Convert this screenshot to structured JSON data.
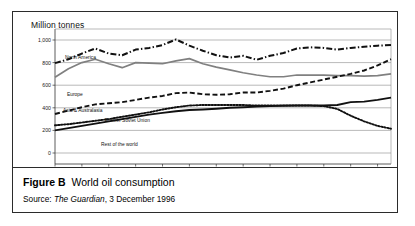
{
  "figure": {
    "label": "Figure B",
    "title": "World oil consumption",
    "source_prefix": "Source:",
    "source_publication": "The Guardian",
    "source_date": ", 3 December 1996"
  },
  "chart_data": {
    "type": "line",
    "title": "World oil consumption",
    "axis_unit_label": "Million tonnes",
    "xlabel": "",
    "ylabel": "Million tonnes",
    "ylim": [
      0,
      1000
    ],
    "yticks": [
      0,
      200,
      400,
      600,
      800,
      1000
    ],
    "ytick_labels": [
      "0",
      "200",
      "400",
      "600",
      "800",
      "1,000"
    ],
    "grid": "horizontal",
    "legend_position": "inline-labels",
    "x": [
      1970,
      1971,
      1972,
      1973,
      1974,
      1975,
      1976,
      1977,
      1978,
      1979,
      1980,
      1981,
      1982,
      1983,
      1984,
      1985,
      1986,
      1987,
      1988,
      1989,
      1990,
      1991,
      1992,
      1993,
      1994,
      1995
    ],
    "xtick_labels": [
      "1970",
      "1972",
      "1974",
      "1976",
      "1978",
      "1980",
      "1982",
      "1984",
      "1986",
      "1988",
      "1990",
      "1992",
      "1994"
    ],
    "series": [
      {
        "name": "North America",
        "style": "dash-dot",
        "color": "#111111",
        "values": [
          795,
          830,
          880,
          925,
          880,
          865,
          915,
          930,
          955,
          1005,
          950,
          905,
          865,
          845,
          860,
          825,
          860,
          885,
          925,
          935,
          930,
          915,
          930,
          940,
          950,
          955
        ]
      },
      {
        "name": "Europe",
        "style": "solid-gray",
        "color": "#808080",
        "values": [
          670,
          745,
          800,
          830,
          790,
          755,
          800,
          795,
          790,
          815,
          835,
          790,
          760,
          735,
          710,
          690,
          675,
          675,
          690,
          690,
          690,
          685,
          685,
          680,
          685,
          700
        ]
      },
      {
        "name": "Asia & Australasia",
        "style": "dashed",
        "color": "#111111",
        "values": [
          345,
          375,
          405,
          430,
          440,
          450,
          470,
          490,
          505,
          530,
          535,
          520,
          515,
          520,
          535,
          535,
          550,
          570,
          600,
          625,
          650,
          675,
          700,
          730,
          775,
          830
        ]
      },
      {
        "name": "Former Soviet Union",
        "style": "dotted",
        "color": "#111111",
        "values": [
          245,
          255,
          270,
          285,
          300,
          320,
          340,
          360,
          385,
          405,
          420,
          425,
          425,
          425,
          425,
          420,
          420,
          420,
          420,
          420,
          415,
          390,
          330,
          280,
          240,
          215
        ]
      },
      {
        "name": "Rest of the world",
        "style": "solid-black",
        "color": "#111111",
        "values": [
          200,
          220,
          240,
          260,
          280,
          300,
          320,
          340,
          355,
          370,
          380,
          385,
          392,
          400,
          405,
          410,
          415,
          418,
          420,
          420,
          420,
          425,
          450,
          455,
          470,
          490
        ]
      }
    ]
  }
}
